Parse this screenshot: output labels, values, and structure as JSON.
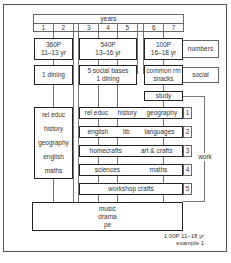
{
  "header": {
    "title": "years",
    "years": [
      "1",
      "2",
      "3",
      "4",
      "5",
      "6",
      "7"
    ]
  },
  "groups": {
    "lower": {
      "numbers_line1": "360P",
      "numbers_line2": "11–13 yr",
      "social": "1 dining",
      "subjects": [
        "rel educ",
        "history",
        "geography",
        "english",
        "maths"
      ]
    },
    "middle": {
      "numbers_line1": "540P",
      "numbers_line2": "13–16 yr",
      "social_line1": "5 social bases",
      "social_line2": "1 dining"
    },
    "upper": {
      "numbers_line1": "100P",
      "numbers_line2": "16–18 yr",
      "social_line1": "common rm",
      "social_line2": "snacks",
      "study": "study"
    }
  },
  "side_labels": {
    "numbers": "numbers",
    "social": "social",
    "work": "work"
  },
  "work_rows": [
    {
      "index": "1",
      "subjects": [
        "rel educ",
        "history",
        "geography"
      ]
    },
    {
      "index": "2",
      "subjects": [
        "english",
        "lib",
        "languages"
      ]
    },
    {
      "index": "3",
      "subjects": [
        "homecrafts",
        "art & crafts"
      ]
    },
    {
      "index": "4",
      "subjects": [
        "sciences",
        "maths"
      ]
    },
    {
      "index": "5",
      "subjects": [
        "workshop crafts"
      ]
    }
  ],
  "shared": {
    "line1": "music",
    "line2": "drama",
    "line3": "pe"
  },
  "footer": {
    "line1": "1 00P 11–18 yr",
    "line2": "example 1"
  }
}
